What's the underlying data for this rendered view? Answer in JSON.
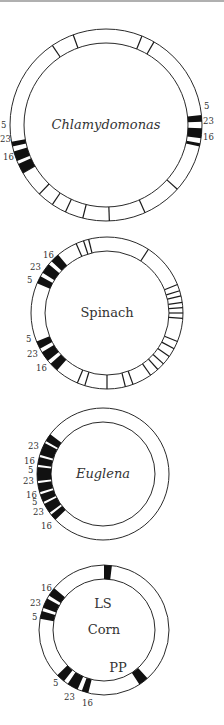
{
  "diagram": {
    "colors": {
      "ring": "#2a2a2a",
      "band": "#111111",
      "text": "#333333"
    },
    "genomes": [
      {
        "name": "Chlamydomonas",
        "italic": true,
        "cx": 106,
        "cy": 125,
        "r_outer": 96,
        "r_inner": 82,
        "ticks": [
          124,
          110,
          68,
          60,
          210,
          226,
          236,
          245,
          256,
          272,
          294,
          318
        ],
        "bands": [
          [
            -13,
            -11
          ],
          [
            -8,
            -2
          ],
          [
            2,
            6
          ],
          [
            190,
            193
          ],
          [
            196,
            202
          ],
          [
            204,
            210
          ]
        ],
        "labels": [
          {
            "text": "5",
            "x": 204,
            "y": 109
          },
          {
            "text": "23",
            "x": 203,
            "y": 124
          },
          {
            "text": "16",
            "x": 203,
            "y": 140
          },
          {
            "text": "5",
            "x": 1,
            "y": 128
          },
          {
            "text": "23",
            "x": 0,
            "y": 142
          },
          {
            "text": "16",
            "x": 3,
            "y": 160
          }
        ]
      },
      {
        "name": "Spinach",
        "italic": false,
        "cx": 107,
        "cy": 313,
        "r_outer": 76,
        "r_inner": 62,
        "ticks": [
          114,
          108,
          104,
          57,
          22,
          17,
          13,
          8,
          4,
          0,
          -4,
          -22,
          -28,
          -35,
          -42,
          -48,
          -55,
          -70,
          -76,
          -90,
          -107,
          -113
        ],
        "bands": [
          [
            130,
            137
          ],
          [
            140,
            148
          ],
          [
            151,
            157
          ],
          [
            202,
            208
          ],
          [
            211,
            219
          ],
          [
            222,
            229
          ]
        ],
        "labels": [
          {
            "text": "16",
            "x": 43,
            "y": 258
          },
          {
            "text": "23",
            "x": 30,
            "y": 270
          },
          {
            "text": "5",
            "x": 27,
            "y": 283
          },
          {
            "text": "5",
            "x": 26,
            "y": 342
          },
          {
            "text": "23",
            "x": 27,
            "y": 357
          },
          {
            "text": "16",
            "x": 36,
            "y": 371
          }
        ]
      },
      {
        "name": "Euglena",
        "italic": true,
        "cx": 103,
        "cy": 474,
        "r_outer": 66,
        "r_inner": 52,
        "ticks": [],
        "bands": [
          [
            143,
            150
          ],
          [
            152,
            163
          ],
          [
            165,
            172
          ],
          [
            174,
            186
          ],
          [
            188,
            196
          ],
          [
            198,
            205
          ],
          [
            207,
            216
          ],
          [
            218,
            224
          ]
        ],
        "labels": [
          {
            "text": "23",
            "x": 28,
            "y": 449
          },
          {
            "text": "16",
            "x": 24,
            "y": 464
          },
          {
            "text": "5",
            "x": 28,
            "y": 473
          },
          {
            "text": "23",
            "x": 23,
            "y": 484
          },
          {
            "text": "16",
            "x": 26,
            "y": 498
          },
          {
            "text": "5",
            "x": 32,
            "y": 505
          },
          {
            "text": "23",
            "x": 33,
            "y": 515
          },
          {
            "text": "16",
            "x": 41,
            "y": 529
          }
        ]
      },
      {
        "name": "Corn",
        "italic": false,
        "cx": 104,
        "cy": 630,
        "r_outer": 65,
        "r_inner": 51,
        "ticks": [],
        "bands": [
          [
            83,
            90
          ],
          [
            140,
            148
          ],
          [
            151,
            160
          ],
          [
            163,
            170
          ],
          [
            224,
            232
          ],
          [
            236,
            246
          ],
          [
            250,
            256
          ],
          [
            303,
            312
          ]
        ],
        "labels": [
          {
            "text": "16",
            "x": 41,
            "y": 591
          },
          {
            "text": "23",
            "x": 30,
            "y": 606
          },
          {
            "text": "5",
            "x": 32,
            "y": 620
          },
          {
            "text": "5",
            "x": 53,
            "y": 686
          },
          {
            "text": "23",
            "x": 64,
            "y": 700
          },
          {
            "text": "16",
            "x": 82,
            "y": 706
          }
        ],
        "markers": [
          {
            "text": "LS",
            "x": 103,
            "y": 608
          },
          {
            "text": "PP",
            "x": 118,
            "y": 672
          }
        ]
      }
    ]
  }
}
